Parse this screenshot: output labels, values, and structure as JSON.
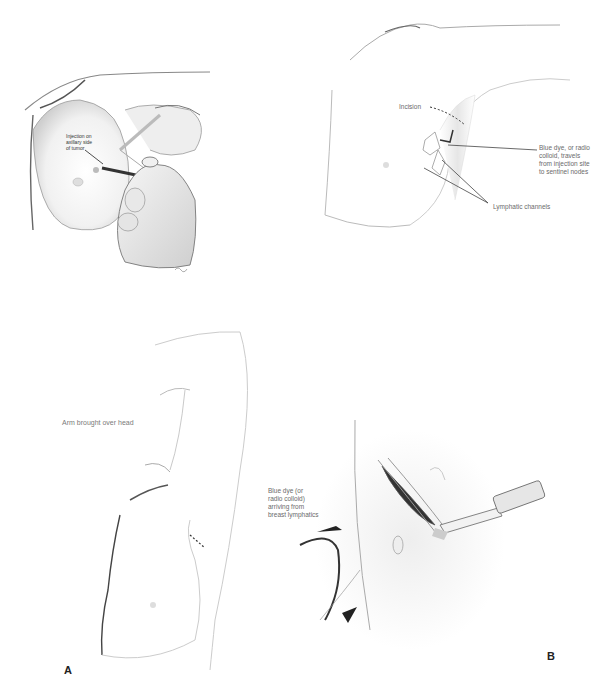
{
  "figure": {
    "panel_A_top": {
      "label_injection": "Injection on\naxillary side\nof tumor"
    },
    "panel_B_top": {
      "label_incision": "Incision",
      "label_blue_dye": "Blue dye, or radio\ncolloid, travels\nfrom injection site\nto sentinel nodes",
      "label_lymphatic": "Lymphatic channels"
    },
    "panel_A_bottom": {
      "label_arm": "Arm brought over head",
      "letter": "A"
    },
    "panel_B_bottom": {
      "label_arriving": "Blue dye (or\nradio colloid)\narriving from\nbreast lymphatics",
      "letter": "B"
    }
  }
}
